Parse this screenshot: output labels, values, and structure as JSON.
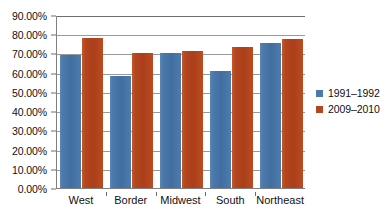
{
  "chart_data": {
    "type": "bar",
    "title": "",
    "subtitle": "",
    "xlabel": "",
    "ylabel": "",
    "categories": [
      "West",
      "Border",
      "Midwest",
      "South",
      "Northeast"
    ],
    "series": [
      {
        "name": "1991–1992",
        "color": "#4a79ab",
        "values": [
          69.0,
          58.5,
          70.0,
          60.8,
          75.6
        ]
      },
      {
        "name": "2009–2010",
        "color": "#b4461f",
        "values": [
          77.8,
          70.0,
          71.2,
          73.6,
          77.5
        ]
      }
    ],
    "ylim": [
      0,
      90
    ],
    "ytick_values": [
      0,
      10,
      20,
      30,
      40,
      50,
      60,
      70,
      80,
      90
    ],
    "ytick_labels": [
      "0.00%",
      "10.00%",
      "20.00%",
      "30.00%",
      "40.00%",
      "50.00%",
      "60.00%",
      "70.00%",
      "80.00%",
      "90.00%"
    ],
    "grid": true,
    "grid_axis": "y",
    "legend_position": "right",
    "value_format": "percent",
    "axis_color": "#6e6e6e",
    "grid_color": "#9a9a9a",
    "background_color": "#ffffff"
  }
}
